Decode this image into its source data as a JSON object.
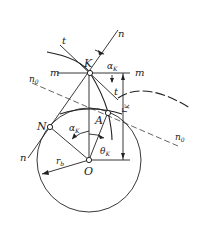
{
  "diagram": {
    "labels": {
      "n_top": "n",
      "t_top": "t",
      "alpha_top": "α",
      "alpha_top_sub": "K",
      "m_left": "m",
      "m_right": "m",
      "K": "K",
      "n0_left": "n",
      "n0_left_sub": "0",
      "t_mid": "t",
      "rK": "r",
      "rK_sub": "K",
      "n0_right": "n",
      "n0_right_sub": "0",
      "N": "N",
      "A": "A",
      "alpha_mid": "α",
      "alpha_mid_sub": "K",
      "theta": "θ",
      "theta_sub": "K",
      "n_bottom": "n",
      "rb": "r",
      "rb_sub": "b",
      "O": "O"
    },
    "colors": {
      "line": "#222222",
      "background": "#ffffff"
    }
  }
}
